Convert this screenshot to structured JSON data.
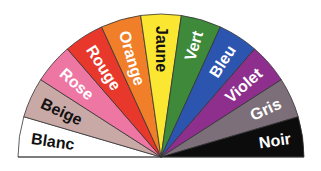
{
  "center": {
    "x": 161,
    "y": 157
  },
  "radius": 143,
  "sectors": [
    {
      "label": "Blanc",
      "fill": "#ffffff",
      "text": "#111111"
    },
    {
      "label": "Beige",
      "fill": "#c9a9a6",
      "text": "#111111"
    },
    {
      "label": "Rose",
      "fill": "#ee76a3",
      "text": "#ffffff"
    },
    {
      "label": "Rouge",
      "fill": "#e8382b",
      "text": "#ffffff"
    },
    {
      "label": "Orange",
      "fill": "#f17f2a",
      "text": "#ffffff"
    },
    {
      "label": "Jaune",
      "fill": "#fbe632",
      "text": "#111111"
    },
    {
      "label": "Vert",
      "fill": "#3e8a3a",
      "text": "#ffffff"
    },
    {
      "label": "Bleu",
      "fill": "#2c55b0",
      "text": "#ffffff"
    },
    {
      "label": "Violet",
      "fill": "#8e2f8e",
      "text": "#ffffff"
    },
    {
      "label": "Gris",
      "fill": "#7d6f7a",
      "text": "#ffffff"
    },
    {
      "label": "Noir",
      "fill": "#0c0c0c",
      "text": "#ffffff"
    }
  ]
}
